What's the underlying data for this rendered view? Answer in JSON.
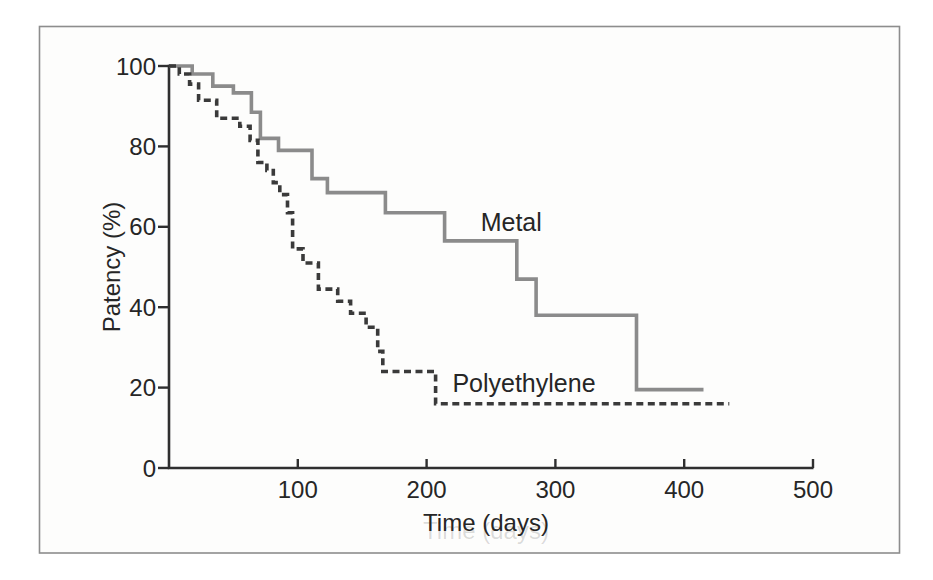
{
  "figure": {
    "background_color": "#ffffff",
    "frame_border_color": "#8d8d8d",
    "axis_color": "#2f2f2f",
    "text_color": "#262626"
  },
  "chart_data": {
    "type": "line",
    "subtype": "kaplan-meier-step",
    "title": "",
    "xlabel": "Time (days)",
    "ylabel": "Patency (%)",
    "xlim": [
      0,
      500
    ],
    "ylim": [
      0,
      100
    ],
    "x_ticks": [
      100,
      200,
      300,
      400,
      500
    ],
    "y_ticks": [
      0,
      20,
      40,
      60,
      80,
      100
    ],
    "grid": false,
    "legend_position": "inline-labels",
    "series": [
      {
        "name": "Metal",
        "line_style": "solid",
        "color": "#8b8b8b",
        "steps": [
          [
            0,
            100
          ],
          [
            18,
            98
          ],
          [
            34,
            95
          ],
          [
            50,
            93.3
          ],
          [
            64,
            88.5
          ],
          [
            71,
            82
          ],
          [
            85,
            79
          ],
          [
            111,
            72
          ],
          [
            123,
            68.5
          ],
          [
            168,
            63.5
          ],
          [
            214,
            56.5
          ],
          [
            270,
            47
          ],
          [
            285,
            38
          ],
          [
            363,
            19.5
          ]
        ],
        "end_day": 415
      },
      {
        "name": "Polyethylene",
        "line_style": "dashed",
        "color": "#3a3a3a",
        "steps": [
          [
            0,
            100
          ],
          [
            8,
            98
          ],
          [
            16,
            95.5
          ],
          [
            23,
            91.5
          ],
          [
            37,
            87
          ],
          [
            55,
            85
          ],
          [
            63,
            81.5
          ],
          [
            69,
            76
          ],
          [
            76,
            74
          ],
          [
            81,
            71
          ],
          [
            86,
            68
          ],
          [
            92,
            63.5
          ],
          [
            96,
            54.5
          ],
          [
            104,
            51
          ],
          [
            116,
            44.5
          ],
          [
            131,
            41.5
          ],
          [
            141,
            38.5
          ],
          [
            153,
            35
          ],
          [
            162,
            29
          ],
          [
            166,
            24
          ],
          [
            207,
            16
          ]
        ],
        "end_day": 435
      }
    ],
    "annotations": [
      {
        "text": "Metal",
        "day": 242,
        "pct": 59
      },
      {
        "text": "Polyethylene",
        "day": 220,
        "pct": 19
      }
    ]
  }
}
